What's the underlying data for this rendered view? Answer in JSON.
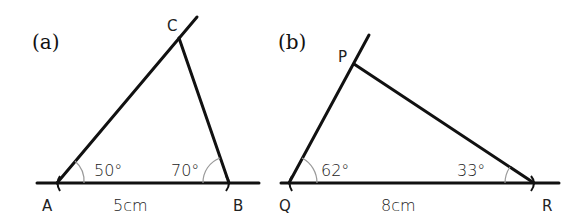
{
  "figures": [
    {
      "part_label": "(a)",
      "vertices": {
        "A": "A",
        "B": "B",
        "C": "C"
      },
      "angles": {
        "A": "50°",
        "B": "70°"
      },
      "base_length": "5cm"
    },
    {
      "part_label": "(b)",
      "vertices": {
        "Q": "Q",
        "R": "R",
        "P": "P"
      },
      "angles": {
        "Q": "62°",
        "R": "33°"
      },
      "base_length": "8cm"
    }
  ],
  "colors": {
    "line": "#111111",
    "arc": "#9a9a9a",
    "text": "#222222",
    "background": "#ffffff"
  }
}
